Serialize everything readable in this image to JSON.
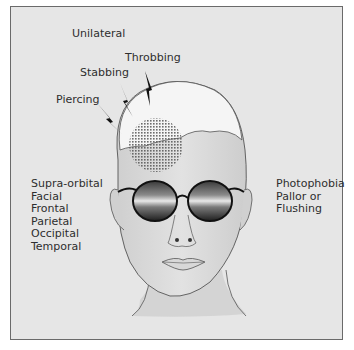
{
  "figure": {
    "pain_quality_labels": [
      {
        "text": "Unilateral"
      },
      {
        "text": "Throbbing"
      },
      {
        "text": "Stabbing"
      },
      {
        "text": "Piercing"
      }
    ],
    "location_labels": [
      "Supra-orbital",
      "Facial",
      "Frontal",
      "Parietal",
      "Occipital",
      "Temporal"
    ],
    "symptom_labels": [
      "Photophobia",
      "Pallor or",
      "Flushing"
    ],
    "colors": {
      "background": "#e6e6e6",
      "frame_border": "#6a6a6a",
      "text": "#2e2e2e",
      "skin": "#d9d9d9",
      "lens_dark": "#2a2a2a"
    }
  }
}
